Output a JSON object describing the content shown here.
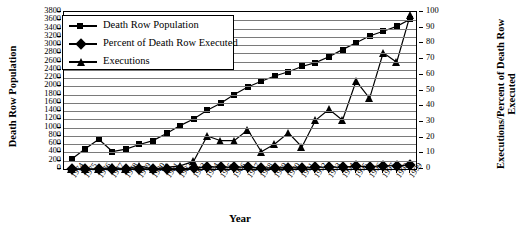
{
  "chart_data": {
    "type": "line",
    "title": "",
    "xlabel": "Year",
    "ylabel_left": "Death Row Population",
    "ylabel_right": "Executions/Percent of Death Row Executed",
    "grid": true,
    "legend_position": "top-left",
    "ylim_left": [
      0,
      3800
    ],
    "ytick_step_left": 200,
    "ylim_right": [
      0,
      100
    ],
    "ytick_step_right": 10,
    "yticks_left": [
      0,
      200,
      400,
      600,
      800,
      1000,
      1200,
      1400,
      1600,
      1800,
      2000,
      2200,
      2400,
      2600,
      2800,
      3000,
      3200,
      3400,
      3600,
      3800
    ],
    "yticks_right": [
      0,
      10,
      20,
      30,
      40,
      50,
      60,
      70,
      80,
      90,
      100
    ],
    "categories": [
      "1974",
      "1975",
      "1976",
      "1977",
      "1978",
      "1979",
      "1980",
      "1981",
      "1982",
      "1983",
      "1984",
      "1985",
      "1986",
      "1987",
      "1988",
      "1989",
      "1990",
      "1991",
      "1992",
      "1993",
      "1994",
      "1995",
      "1996",
      "1997",
      "1998",
      "1999"
    ],
    "series": [
      {
        "name": "Death Row Population",
        "marker": "square",
        "axis": "left",
        "values": [
          244,
          488,
          720,
          423,
          482,
          593,
          688,
          860,
          1050,
          1209,
          1420,
          1591,
          1800,
          1984,
          2124,
          2250,
          2356,
          2482,
          2575,
          2716,
          2890,
          3054,
          3219,
          3335,
          3452,
          3625
        ]
      },
      {
        "name": "Percent of Death Row Executed",
        "marker": "diamond",
        "axis": "right",
        "values": [
          0.0,
          0.0,
          0.0,
          0.2,
          0.0,
          0.3,
          0.0,
          0.1,
          0.2,
          0.4,
          1.5,
          1.2,
          1.0,
          1.3,
          0.5,
          0.7,
          0.9,
          0.6,
          1.1,
          1.3,
          1.1,
          1.8,
          1.4,
          2.2,
          2.0,
          2.6
        ]
      },
      {
        "name": "Executions",
        "marker": "triangle",
        "axis": "right",
        "values": [
          0,
          0,
          0,
          1,
          0,
          2,
          0,
          1,
          2,
          5,
          21,
          18,
          18,
          25,
          11,
          16,
          23,
          14,
          31,
          38,
          31,
          56,
          45,
          74,
          68,
          98
        ]
      }
    ]
  },
  "legend": {
    "items": [
      {
        "label": "Death Row Population",
        "marker": "square"
      },
      {
        "label": "Percent of Death Row Executed",
        "marker": "diamond"
      },
      {
        "label": "Executions",
        "marker": "triangle"
      }
    ]
  }
}
